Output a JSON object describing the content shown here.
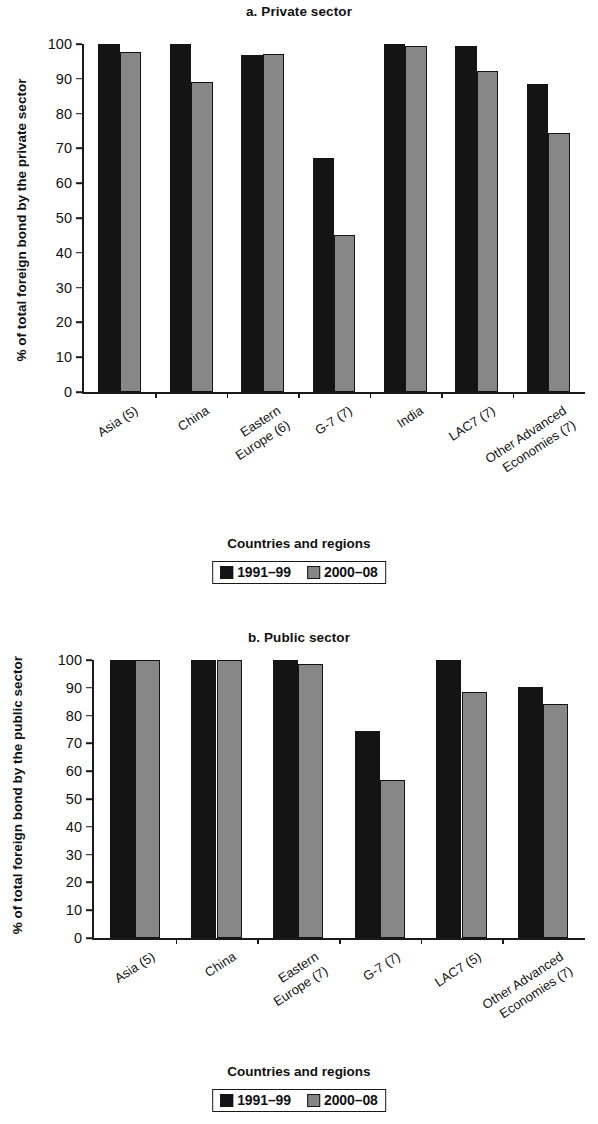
{
  "figure": {
    "legend": {
      "series": [
        {
          "label": "1991–99",
          "color": "#141414"
        },
        {
          "label": "2000–08",
          "color": "#878787"
        }
      ]
    },
    "xaxis_title": "Countries and regions"
  },
  "chart_data": [
    {
      "type": "bar",
      "title": "a. Private sector",
      "xlabel": "Countries and regions",
      "ylabel": "% of total foreign bond by the private sector",
      "ylim": [
        0,
        100
      ],
      "yticks": [
        0,
        10,
        20,
        30,
        40,
        50,
        60,
        70,
        80,
        90,
        100
      ],
      "grid": false,
      "legend_position": "bottom",
      "categories": [
        "Asia (5)",
        "China",
        "Eastern\nEurope (6)",
        "G-7 (7)",
        "India",
        "LAC7 (7)",
        "Other Advanced\nEconomies (7)"
      ],
      "series": [
        {
          "name": "1991–99",
          "color": "#141414",
          "values": [
            100,
            100,
            96.8,
            67.2,
            100,
            99.5,
            88.5
          ]
        },
        {
          "name": "2000–08",
          "color": "#878787",
          "values": [
            97.6,
            89,
            97,
            45,
            99.3,
            92.3,
            74.4
          ]
        }
      ]
    },
    {
      "type": "bar",
      "title": "b. Public sector",
      "xlabel": "Countries and regions",
      "ylabel": "% of total foreign bond by\nthe public sector",
      "ylim": [
        0,
        100
      ],
      "yticks": [
        0,
        10,
        20,
        30,
        40,
        50,
        60,
        70,
        80,
        90,
        100
      ],
      "grid": false,
      "legend_position": "bottom",
      "categories": [
        "Asia (5)",
        "China",
        "Eastern\nEurope (7)",
        "G-7 (7)",
        "LAC7 (5)",
        "Other Advanced\nEconomies (7)"
      ],
      "series": [
        {
          "name": "1991–99",
          "color": "#141414",
          "values": [
            100,
            100,
            100,
            74.5,
            100,
            90.2
          ]
        },
        {
          "name": "2000–08",
          "color": "#878787",
          "values": [
            100,
            100,
            98.4,
            57,
            88.4,
            84
          ]
        }
      ]
    }
  ]
}
